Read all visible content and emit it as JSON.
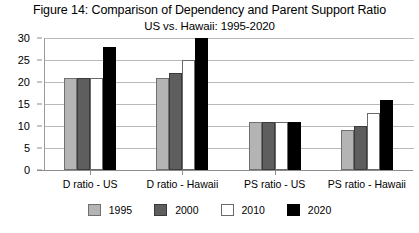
{
  "chart_data": {
    "type": "bar",
    "title": "Figure 14: Comparison of Dependency and Parent Support Ratio",
    "subtitle": "US vs. Hawaii: 1995-2020",
    "xlabel": "",
    "ylabel": "",
    "ylim": [
      0,
      30
    ],
    "ytick_step": 5,
    "yticks": [
      30,
      25,
      20,
      15,
      10,
      5,
      0
    ],
    "grid": true,
    "legend_position": "bottom",
    "categories": [
      "D ratio - US",
      "D ratio - Hawaii",
      "PS ratio - US",
      "PS ratio - Hawaii"
    ],
    "series": [
      {
        "name": "1995",
        "color": "#b4b4b4",
        "values": [
          21,
          21,
          11,
          9
        ]
      },
      {
        "name": "2000",
        "color": "#5e5e5e",
        "values": [
          21,
          22,
          11,
          10
        ]
      },
      {
        "name": "2010",
        "color": "#ffffff",
        "values": [
          21,
          25,
          11,
          13
        ]
      },
      {
        "name": "2020",
        "color": "#000000",
        "values": [
          28,
          30,
          11,
          16
        ]
      }
    ]
  }
}
